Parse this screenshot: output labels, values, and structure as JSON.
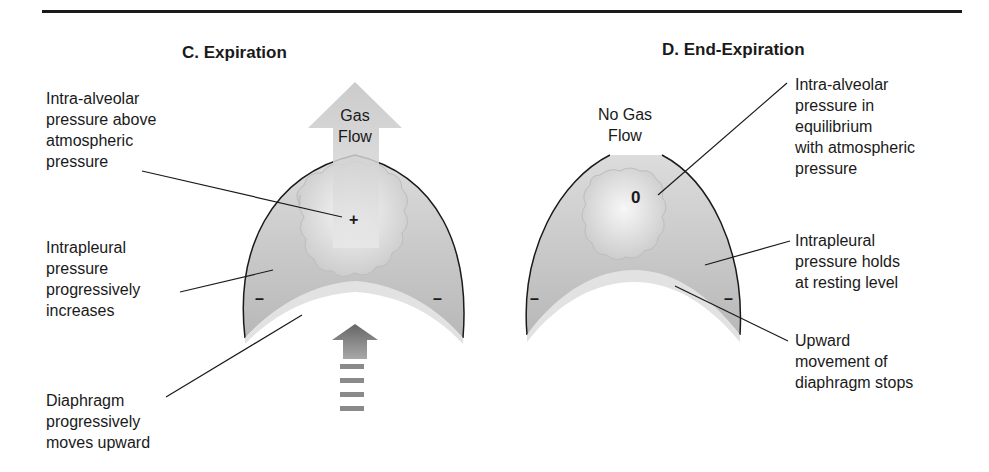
{
  "panels": [
    {
      "id": "C",
      "title": "C. Expiration",
      "flow_label": "Gas\nFlow",
      "alveolar_sign": "+",
      "pleural_signs": [
        "–",
        "–"
      ],
      "annotations": [
        {
          "text": "Intra-alveolar\npressure above\natmospheric\npressure"
        },
        {
          "text": "Intrapleural\npressure\nprogressively\nincreases"
        },
        {
          "text": "Diaphragm\nprogressively\nmoves upward"
        }
      ]
    },
    {
      "id": "D",
      "title": "D. End-Expiration",
      "flow_label": "No Gas\nFlow",
      "alveolar_sign": "0",
      "pleural_signs": [
        "–",
        "–"
      ],
      "annotations": [
        {
          "text": "Intra-alveolar\npressure in\nequilibrium\nwith atmospheric\npressure"
        },
        {
          "text": "Intrapleural\npressure holds\nat resting level"
        },
        {
          "text": "Upward\nmovement of\ndiaphragm stops"
        }
      ]
    }
  ],
  "colors": {
    "pleural_fill": "#c4c4c4",
    "alveolus_fill": "#e4e4e4",
    "diaphragm_band": "#e6e6e6",
    "arrow_light": "#cfcfcf",
    "arrow_dark": "#7a7a7a",
    "outline": "#1a1a1a"
  }
}
